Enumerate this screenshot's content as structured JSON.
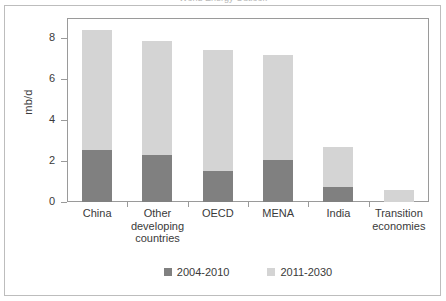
{
  "figure": {
    "cropped_title": "World Energy Outlook"
  },
  "chart_data": {
    "type": "bar",
    "stacked": true,
    "title": "",
    "xlabel": "",
    "ylabel": "mb/d",
    "ylim": [
      0,
      9
    ],
    "yticks": [
      0,
      2,
      4,
      6,
      8
    ],
    "ytick_labels": [
      "0",
      "2",
      "4",
      "6",
      "8"
    ],
    "grid": false,
    "legend_position": "bottom",
    "categories": [
      "China",
      "Other developing countries",
      "OECD",
      "MENA",
      "India",
      "Transition economies"
    ],
    "category_lines": [
      [
        "China"
      ],
      [
        "Other",
        "developing",
        "countries"
      ],
      [
        "OECD"
      ],
      [
        "MENA"
      ],
      [
        "India"
      ],
      [
        "Transition",
        "economies"
      ]
    ],
    "series": [
      {
        "name": "2004-2010",
        "color": "#808080",
        "values": [
          2.55,
          2.3,
          1.5,
          2.05,
          0.75,
          0.0
        ]
      },
      {
        "name": "2011-2030",
        "color": "#d4d4d4",
        "values": [
          5.85,
          5.6,
          5.95,
          5.15,
          1.95,
          0.6
        ]
      }
    ],
    "totals": [
      8.4,
      7.9,
      7.45,
      7.2,
      2.7,
      0.6
    ]
  },
  "colors": {
    "series_2004_2010": "#808080",
    "series_2011_2030": "#d4d4d4",
    "axis": "#9a9a9a",
    "text": "#3a3a3a",
    "frame": "#bdbdbd",
    "background": "#ffffff"
  }
}
